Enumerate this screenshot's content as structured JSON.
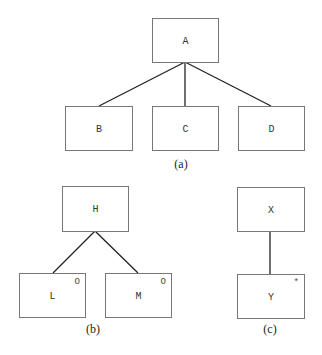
{
  "diagrams": [
    {
      "caption": "(a)",
      "nodes": [
        {
          "id": "A",
          "label": "A",
          "mark": ""
        },
        {
          "id": "B",
          "label": "B",
          "mark": ""
        },
        {
          "id": "C",
          "label": "C",
          "mark": ""
        },
        {
          "id": "D",
          "label": "D",
          "mark": ""
        }
      ],
      "edges": [
        [
          "A",
          "B"
        ],
        [
          "A",
          "C"
        ],
        [
          "A",
          "D"
        ]
      ]
    },
    {
      "caption": "(b)",
      "nodes": [
        {
          "id": "H",
          "label": "H",
          "mark": ""
        },
        {
          "id": "L",
          "label": "L",
          "mark": "O"
        },
        {
          "id": "M",
          "label": "M",
          "mark": "O"
        }
      ],
      "edges": [
        [
          "H",
          "L"
        ],
        [
          "H",
          "M"
        ]
      ]
    },
    {
      "caption": "(c)",
      "nodes": [
        {
          "id": "X",
          "label": "X",
          "mark": ""
        },
        {
          "id": "Y",
          "label": "Y",
          "mark": "*"
        }
      ],
      "edges": [
        [
          "X",
          "Y"
        ]
      ]
    }
  ]
}
